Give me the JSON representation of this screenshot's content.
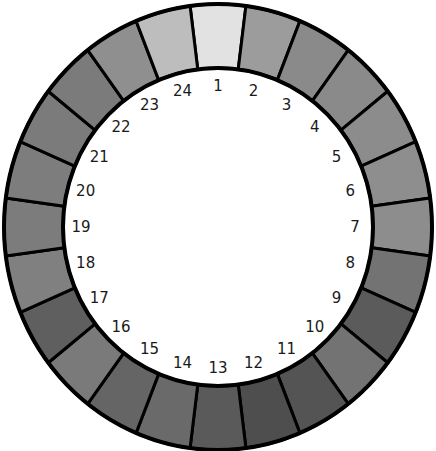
{
  "diagram": {
    "type": "segmented-color-ring",
    "segment_count": 24,
    "start_position": "top",
    "direction": "clockwise",
    "geometry": {
      "cx": 218,
      "cy": 227,
      "outer_rx": 214,
      "outer_ry": 223,
      "inner_rx": 155,
      "inner_ry": 159,
      "label_rx": 137,
      "label_ry": 141
    },
    "segments": [
      {
        "label": "1",
        "color": "#e2e2e2"
      },
      {
        "label": "2",
        "color": "#9c9c9c"
      },
      {
        "label": "3",
        "color": "#8a8a8a"
      },
      {
        "label": "4",
        "color": "#8a8a8a"
      },
      {
        "label": "5",
        "color": "#8c8c8c"
      },
      {
        "label": "6",
        "color": "#8e8e8e"
      },
      {
        "label": "7",
        "color": "#8d8d8d"
      },
      {
        "label": "8",
        "color": "#737373"
      },
      {
        "label": "9",
        "color": "#5b5b5b"
      },
      {
        "label": "10",
        "color": "#737373"
      },
      {
        "label": "11",
        "color": "#545454"
      },
      {
        "label": "12",
        "color": "#4e4e4e"
      },
      {
        "label": "13",
        "color": "#5a5a5a"
      },
      {
        "label": "14",
        "color": "#6a6a6a"
      },
      {
        "label": "15",
        "color": "#656565"
      },
      {
        "label": "16",
        "color": "#7a7a7a"
      },
      {
        "label": "17",
        "color": "#5f5f5f"
      },
      {
        "label": "18",
        "color": "#808080"
      },
      {
        "label": "19",
        "color": "#7c7c7c"
      },
      {
        "label": "20",
        "color": "#7d7d7d"
      },
      {
        "label": "21",
        "color": "#7b7b7b"
      },
      {
        "label": "22",
        "color": "#7b7b7b"
      },
      {
        "label": "23",
        "color": "#8f8f8f"
      },
      {
        "label": "24",
        "color": "#bdbdbd"
      }
    ]
  }
}
